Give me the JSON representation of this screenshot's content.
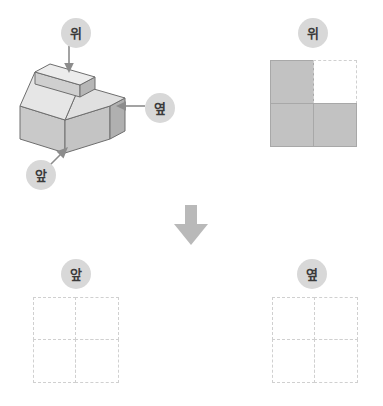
{
  "labels": {
    "top": "위",
    "side": "옆",
    "front": "앞"
  },
  "solid": {
    "name": "isometric-cube-solid",
    "description": "2x2 base layer of cubes with one cube stacked on the back-left position",
    "base_rows": 2,
    "base_cols": 2,
    "stacked_cubes": 1,
    "face_colors": {
      "top": "#e3e3e3",
      "front": "#c9c9c9",
      "right": "#b0b0b0",
      "outline": "#6e6e6e"
    }
  },
  "views": {
    "top_view": {
      "label": "위",
      "rows": 2,
      "cols": 2,
      "cells": [
        [
          {
            "filled": true
          },
          {
            "filled": false
          }
        ],
        [
          {
            "filled": true
          },
          {
            "filled": true
          }
        ]
      ]
    },
    "front_view": {
      "label": "앞",
      "rows": 2,
      "cols": 2,
      "cells": [
        [
          {
            "filled": false
          },
          {
            "filled": false
          }
        ],
        [
          {
            "filled": false
          },
          {
            "filled": false
          }
        ]
      ]
    },
    "side_view": {
      "label": "옆",
      "rows": 2,
      "cols": 2,
      "cells": [
        [
          {
            "filled": false
          },
          {
            "filled": false
          }
        ],
        [
          {
            "filled": false
          },
          {
            "filled": false
          }
        ]
      ]
    }
  },
  "arrows": {
    "center_down": "down-arrow",
    "top_to_solid": "down-arrow",
    "side_to_solid": "left-arrow",
    "front_to_solid": "diagonal-up-right-arrow"
  },
  "colors": {
    "badge_bg": "#d8d8d8",
    "badge_text": "#3b3b3b",
    "filled_cell": "#c2c2c2",
    "dashed_border": "#d0d0d0",
    "arrow_gray": "#9a9a9a",
    "thin_arrow_gray": "#8c8c8c"
  }
}
